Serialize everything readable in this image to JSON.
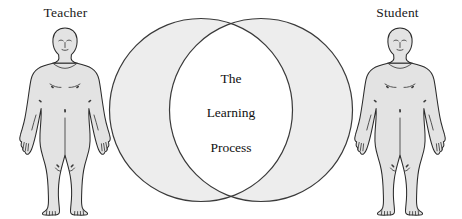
{
  "diagram": {
    "type": "venn-two-circle",
    "title": "",
    "left_label": "Teacher",
    "right_label": "Student",
    "left_figure_icon": "human-body-outline-icon",
    "right_figure_icon": "human-body-outline-icon",
    "intersection_lines": [
      "The",
      "Learning",
      "Process"
    ],
    "intersection_text": "The Learning Process",
    "colors": {
      "circle_fill": "#ededed",
      "circle_stroke": "#3a3a3a",
      "intersection_fill": "#ffffff",
      "figure_fill": "#e0e0e0",
      "figure_stroke": "#2b2b2b",
      "text": "#111111",
      "background": "#ffffff"
    }
  }
}
